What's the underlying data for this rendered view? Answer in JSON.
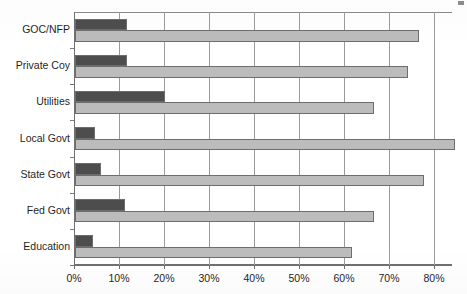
{
  "chart_data": {
    "type": "bar",
    "orientation": "horizontal",
    "title": "",
    "xlabel": "",
    "ylabel": "",
    "xlim": [
      0,
      84.5
    ],
    "xticks": [
      0,
      10,
      20,
      30,
      40,
      50,
      60,
      70,
      80
    ],
    "xtick_labels": [
      "0%",
      "10%",
      "20%",
      "30%",
      "40%",
      "50%",
      "60%",
      "70%",
      "80%"
    ],
    "grid": true,
    "legend": "none",
    "categories": [
      "GOC/NFP",
      "Private Coy",
      "Utilities",
      "Local Govt",
      "State Govt",
      "Fed Govt",
      "Education"
    ],
    "series": [
      {
        "name": "series-1",
        "color": "#4d4d4d",
        "values": [
          11.5,
          11.5,
          20.0,
          4.5,
          5.8,
          11.0,
          4.0
        ]
      },
      {
        "name": "series-2",
        "color": "#bcbcbc",
        "values": [
          76.5,
          74.0,
          66.5,
          84.5,
          77.5,
          66.5,
          61.5
        ]
      }
    ]
  },
  "page": {
    "title_sliver": "",
    "corner_mark": ""
  }
}
